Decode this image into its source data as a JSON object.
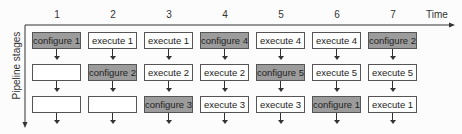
{
  "diagram": {
    "x_axis_label": "Time",
    "y_axis_label": "Pipeline stages",
    "columns": [
      "1",
      "2",
      "3",
      "4",
      "5",
      "6",
      "7"
    ],
    "rows": [
      [
        {
          "label": "configure 1",
          "type": "configure"
        },
        {
          "label": "execute 1",
          "type": "execute"
        },
        {
          "label": "execute 1",
          "type": "execute"
        },
        {
          "label": "configure 4",
          "type": "configure"
        },
        {
          "label": "execute 4",
          "type": "execute"
        },
        {
          "label": "execute 4",
          "type": "execute"
        },
        {
          "label": "configure 2",
          "type": "configure"
        }
      ],
      [
        {
          "label": "",
          "type": "empty"
        },
        {
          "label": "configure 2",
          "type": "configure"
        },
        {
          "label": "execute 2",
          "type": "execute"
        },
        {
          "label": "execute 2",
          "type": "execute"
        },
        {
          "label": "configure 5",
          "type": "configure"
        },
        {
          "label": "execute 5",
          "type": "execute"
        },
        {
          "label": "execute 5",
          "type": "execute"
        }
      ],
      [
        {
          "label": "",
          "type": "empty"
        },
        {
          "label": "",
          "type": "empty"
        },
        {
          "label": "configure 3",
          "type": "configure"
        },
        {
          "label": "execute 3",
          "type": "execute"
        },
        {
          "label": "execute 3",
          "type": "execute"
        },
        {
          "label": "configure 1",
          "type": "configure"
        },
        {
          "label": "execute 1",
          "type": "execute"
        }
      ]
    ],
    "colors": {
      "configure_fill": "#9c9c9c",
      "execute_fill": "#ffffff",
      "border": "#555555"
    }
  }
}
